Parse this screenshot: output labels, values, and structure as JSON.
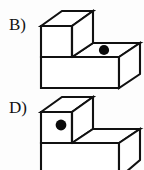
{
  "page": {
    "background_color": "#fdfdfd",
    "width": 144,
    "height": 170
  },
  "options": [
    {
      "id": "option-b",
      "label": "B)",
      "shape": "isometric-step-block",
      "orientation": "tall-block-on-left-step-descends-to-right",
      "outline_color": "#111111",
      "face_color": "#ffffff",
      "dot": {
        "color": "#0a0a0a",
        "placement": "top face of the lower right step",
        "cx": 104,
        "cy": 50,
        "r": 5.1
      }
    },
    {
      "id": "option-d",
      "label": "D)",
      "shape": "isometric-step-block",
      "orientation": "tall-block-on-left-step-descends-to-right-cropped-at-bottom",
      "outline_color": "#111111",
      "face_color": "#ffffff",
      "dot": {
        "color": "#0a0a0a",
        "placement": "front left vertical face of the tall block",
        "cx": 61,
        "cy": 125,
        "r": 5.4
      }
    }
  ]
}
